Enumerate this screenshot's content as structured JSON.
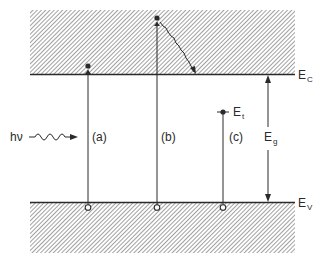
{
  "diagram": {
    "title": "",
    "type": "energy band diagram",
    "colors": {
      "ink": "#2a2a2a",
      "hatch": "#6e6e6e",
      "background": "#ffffff"
    },
    "bands": {
      "conduction": {
        "label_main": "E",
        "label_sub": "C",
        "name": "conduction band edge"
      },
      "valence": {
        "label_main": "E",
        "label_sub": "V",
        "name": "valence band edge"
      }
    },
    "gap": {
      "label_main": "E",
      "label_sub": "g",
      "name": "band gap"
    },
    "trap": {
      "label_main": "E",
      "label_sub": "t",
      "name": "trap level"
    },
    "photon": {
      "label": "hν",
      "name": "incident photon"
    },
    "transitions": [
      {
        "id": "a",
        "label": "(a)",
        "description": "band-to-band excitation to conduction band edge"
      },
      {
        "id": "b",
        "label": "(b)",
        "description": "excitation above band edge with thermalization to E_C"
      },
      {
        "id": "c",
        "label": "(c)",
        "description": "excitation from valence band to trap level E_t"
      }
    ]
  }
}
